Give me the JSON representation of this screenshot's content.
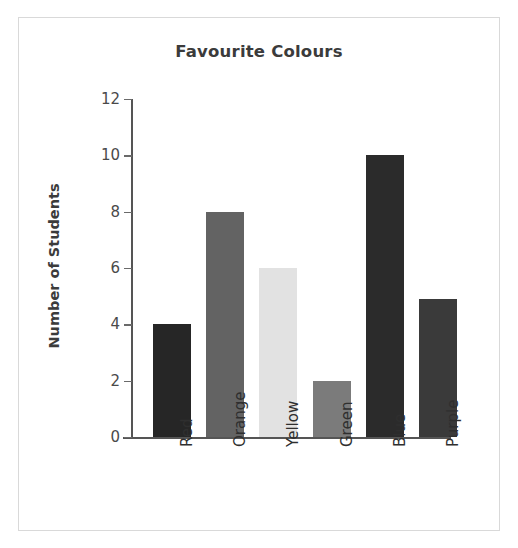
{
  "chart_data": {
    "type": "bar",
    "title": "Favourite Colours",
    "xlabel": "",
    "ylabel": "Number of Students",
    "categories": [
      "Red",
      "Orange",
      "Yellow",
      "Green",
      "Blue",
      "Purple"
    ],
    "values": [
      4,
      8,
      6,
      2,
      10,
      4.9
    ],
    "series": [
      {
        "name": "Number of Students",
        "values": [
          4,
          8,
          6,
          2,
          10,
          4.9
        ]
      }
    ],
    "bar_colors": [
      "#262626",
      "#636363",
      "#e2e2e2",
      "#7b7b7b",
      "#2b2b2b",
      "#3a3a3a"
    ],
    "ylim": [
      0,
      12
    ],
    "yticks": [
      0,
      2,
      4,
      6,
      8,
      10,
      12
    ],
    "ytick_labels": [
      "0",
      "2",
      "4",
      "6",
      "8",
      "10",
      "12"
    ],
    "grid": false,
    "legend": false,
    "legend_position": "none",
    "xtick_rotation": 90
  },
  "figure": {
    "background": "#ffffff",
    "border_color": "#d9d9d9",
    "axis_color": "#555555",
    "title_color": "#3b3b3b",
    "tick_label_color": "#4a4a4a"
  }
}
